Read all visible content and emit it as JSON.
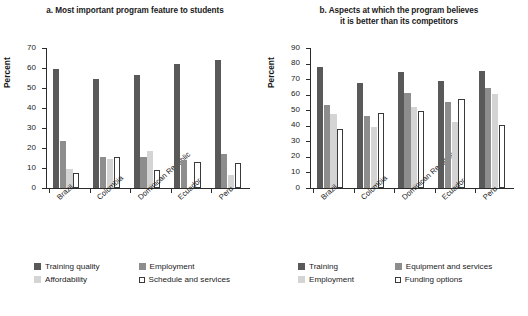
{
  "colors": {
    "series_0": "#595959",
    "series_1": "#8d8d8d",
    "series_2": "#d4d4d4",
    "series_3": "#ffffff",
    "axis": "#2b2b2b",
    "text": "#1a1a1a",
    "background": "#ffffff"
  },
  "panels": [
    {
      "id": "panel-a",
      "title": "a. Most important program feature to students",
      "ylabel": "Percent",
      "yticks": [
        "0",
        "10",
        "20",
        "30",
        "40",
        "50",
        "60",
        "70"
      ]
    },
    {
      "id": "panel-b",
      "title": "b. Aspects at which the program believes it is better than its competitors",
      "title_line_1": "b. Aspects at which the program believes",
      "title_line_2": "it is better than its competitors",
      "ylabel": "Percent",
      "yticks": [
        "0",
        "10",
        "20",
        "30",
        "40",
        "50",
        "60",
        "70",
        "80",
        "90"
      ]
    }
  ],
  "chart_data": [
    {
      "type": "bar",
      "title": "a. Most important program feature to students",
      "xlabel": "",
      "ylabel": "Percent",
      "ylim": [
        0,
        70
      ],
      "ytick_step": 10,
      "grid": false,
      "legend_position": "bottom",
      "categories": [
        "Brazil",
        "Colombia",
        "Dominican Republic",
        "Ecuador",
        "Peru"
      ],
      "series": [
        {
          "name": "Training quality",
          "color": "#595959",
          "values": [
            59.5,
            54.5,
            56.5,
            62.0,
            64.0
          ]
        },
        {
          "name": "Employment",
          "color": "#8d8d8d",
          "values": [
            23.5,
            15.5,
            15.5,
            14.0,
            17.0
          ]
        },
        {
          "name": "Affordability",
          "color": "#d4d4d4",
          "values": [
            9.5,
            14.5,
            18.5,
            0.0,
            6.5
          ]
        },
        {
          "name": "Schedule and services",
          "color": "#ffffff",
          "values": [
            7.5,
            15.5,
            9.0,
            13.0,
            12.5
          ]
        }
      ]
    },
    {
      "type": "bar",
      "title": "b. Aspects at which the program believes it is better than its competitors",
      "xlabel": "",
      "ylabel": "Percent",
      "ylim": [
        0,
        90
      ],
      "ytick_step": 10,
      "grid": false,
      "legend_position": "bottom",
      "categories": [
        "Brazil",
        "Colombia",
        "Dominican Republic",
        "Ecuador",
        "Peru"
      ],
      "series": [
        {
          "name": "Training",
          "color": "#595959",
          "values": [
            78.0,
            67.5,
            74.5,
            69.0,
            75.5
          ]
        },
        {
          "name": "Equipment and services",
          "color": "#8d8d8d",
          "values": [
            53.5,
            46.5,
            61.0,
            55.5,
            64.0
          ]
        },
        {
          "name": "Employment",
          "color": "#d4d4d4",
          "values": [
            47.5,
            39.0,
            52.0,
            42.5,
            60.5
          ]
        },
        {
          "name": "Funding options",
          "color": "#ffffff",
          "values": [
            38.0,
            48.0,
            49.5,
            57.5,
            40.5
          ]
        }
      ]
    }
  ],
  "legends": [
    {
      "items": [
        "Training quality",
        "Employment",
        "Affordability",
        "Schedule and services"
      ]
    },
    {
      "items": [
        "Training",
        "Equipment and services",
        "Employment",
        "Funding options"
      ]
    }
  ]
}
